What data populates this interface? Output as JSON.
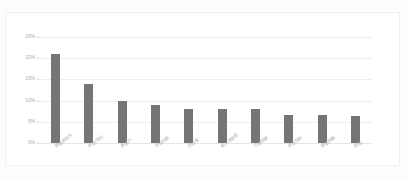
{
  "document": {
    "header_fragment": "",
    "background_color": "#fdfdfd"
  },
  "chart": {
    "frame_border_color": "#f0f0f2",
    "plot_background": "#ffffff",
    "bar_color": "#757575",
    "gridline_color": "#eceef0",
    "axis_label_color": "#a8a8ad",
    "category_label_color": "#b6b6bb"
  },
  "chart_data": {
    "type": "bar",
    "title": "",
    "subtitle": "",
    "xlabel": "",
    "ylabel": "",
    "ylim": [
      0,
      25
    ],
    "ytick_labels": [
      "25%",
      "20%",
      "15%",
      "10%",
      "5%",
      "0%"
    ],
    "ytick_values": [
      25,
      20,
      15,
      10,
      5,
      0
    ],
    "grid": true,
    "grid_axis": "y",
    "legend": false,
    "legend_position": "none",
    "orientation": "vertical",
    "categories": [
      "销售额增长",
      "利润/毛利",
      "新客户",
      "市场份额",
      "回款率",
      "客户满意度",
      "订单数量",
      "成本控制",
      "渠道拓展",
      "其他"
    ],
    "values": [
      21.0,
      14.0,
      10.0,
      9.0,
      8.0,
      8.0,
      8.0,
      6.5,
      6.5,
      6.3
    ],
    "value_labels": [
      "21%",
      "14%",
      "10%",
      "9%",
      "8%",
      "8%",
      "8%",
      "6.5%",
      "6.5%",
      "6.3%"
    ]
  }
}
